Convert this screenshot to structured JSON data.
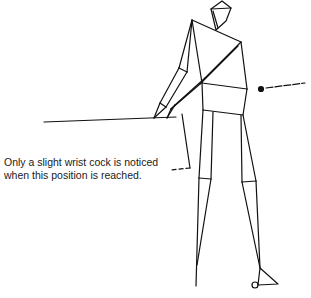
{
  "figure": {
    "type": "stick-figure golf swing illustration",
    "stroke_color": "#111111",
    "background": "#ffffff"
  },
  "caption": {
    "line1": "Only a slight wrist cock is noticed",
    "line2": "when this position is reached."
  },
  "annotations": {
    "pointer_dot": "dot with dashed leader line to the right of the hip"
  }
}
